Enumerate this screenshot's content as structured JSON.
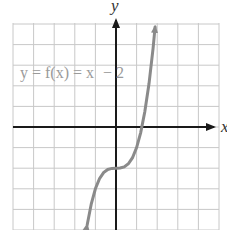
{
  "chart_data": {
    "type": "line",
    "title": "",
    "function_label": "y = f(x) = x³ − 2",
    "function_label_parts": {
      "lhs": "y = f(x) = x",
      "exponent": "3",
      "rhs": " − 2"
    },
    "xlabel": "x",
    "ylabel": "y",
    "xlim": [
      -5,
      5
    ],
    "ylim": [
      -5,
      5
    ],
    "grid": true,
    "legend": "none",
    "series": [
      {
        "name": "f(x) = x^3 - 2",
        "x": [
          -1.4,
          -1.2,
          -1.0,
          -0.8,
          -0.6,
          -0.4,
          -0.2,
          0,
          0.2,
          0.4,
          0.6,
          0.8,
          1.0,
          1.2,
          1.4,
          1.6,
          1.8,
          1.9
        ],
        "values": [
          -4.744,
          -3.728,
          -3.0,
          -2.512,
          -2.216,
          -2.064,
          -2.008,
          -2.0,
          -1.992,
          -1.936,
          -1.784,
          -1.488,
          -1.0,
          -0.272,
          0.744,
          2.096,
          3.832,
          4.859
        ]
      }
    ],
    "annotations": [
      "Arrowheads at both curve ends",
      "Inflection point at (0, -2)"
    ]
  },
  "colors": {
    "grid": "#c8c8c8",
    "axes": "#1a1a1a",
    "curve": "#8a8a8a",
    "label": "#9a9a9a"
  },
  "axes": {
    "x_label": "x",
    "y_label": "y"
  }
}
